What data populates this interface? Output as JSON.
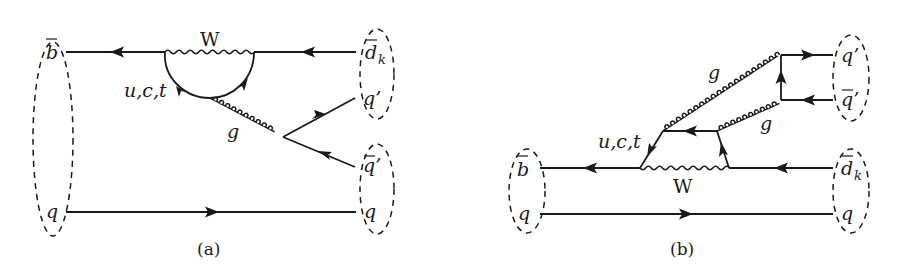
{
  "figure": {
    "panels": [
      {
        "id": "a",
        "caption": "(a)",
        "labels": {
          "b_bar": "b",
          "q_left": "q",
          "W": "W",
          "loop_quarks": "u,c,t",
          "gluon": "g",
          "d_k": "d",
          "d_k_sub": "k",
          "q_prime": "q’",
          "q_prime_bar": "q’",
          "q_right": "q"
        }
      },
      {
        "id": "b",
        "caption": "(b)",
        "labels": {
          "b_bar": "b",
          "q_left": "q",
          "W": "W",
          "loop_quarks": "u,c,t",
          "gluon_upper": "g",
          "gluon_lower": "g",
          "d_k": "d",
          "d_k_sub": "k",
          "q_prime": "q’",
          "q_prime_bar": "q’",
          "q_right": "q"
        }
      }
    ],
    "colors": {
      "ink": "#1a1a1a",
      "background": "#ffffff"
    }
  }
}
